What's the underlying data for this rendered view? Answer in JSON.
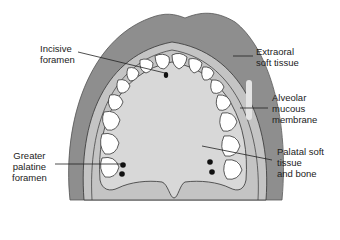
{
  "labels": {
    "incisive_foramen": [
      "Incisive",
      "foramen"
    ],
    "extraoral_soft_tissue": [
      "Extraoral",
      "soft tissue"
    ],
    "alveolar_mucous_membrane": [
      "Alveolar",
      "mucous",
      "membrane"
    ],
    "greater_palatine_foramen": [
      "Greater",
      "palatine",
      "foramen"
    ],
    "palatal_soft_tissue_and_bone": [
      "Palatal soft",
      "tissue",
      "and bone"
    ]
  },
  "colors": {
    "extraoral": "#8e8e8e",
    "alveolar": "#c4c4c4",
    "palate": "#d6d6d6",
    "teeth": "#ffffff",
    "outline": "#333333",
    "foramen": "#111111"
  }
}
